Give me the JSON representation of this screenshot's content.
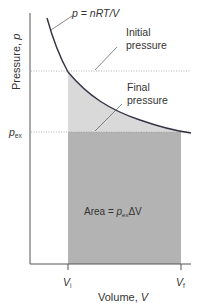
{
  "labels": {
    "equation_p": "p",
    "equation_rest": " = nRT/V",
    "initial_pressure_line1": "Initial",
    "initial_pressure_line2": "pressure",
    "final_pressure_line1": "Final",
    "final_pressure_line2": "pressure",
    "pex_p": "p",
    "pex_sub": "ex",
    "area_prefix": "Area = ",
    "area_p": "p",
    "area_sub": "ex",
    "area_suffix": "ΔV",
    "y_axis": "Pressure, ",
    "y_axis_var": "p",
    "x_axis": "Volume, ",
    "x_axis_var": "V",
    "vi_V": "V",
    "vi_sub": "i",
    "vf_V": "V",
    "vf_sub": "f"
  },
  "colors": {
    "curve": "#333344",
    "axis": "#555555",
    "dark_shade": "#b3b3b3",
    "light_shade": "#d9d9d9",
    "dotted": "#999999",
    "text": "#333333"
  }
}
